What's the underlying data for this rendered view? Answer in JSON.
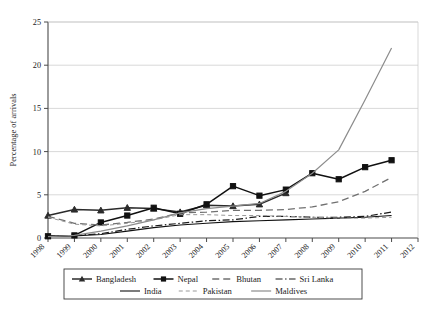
{
  "chart_data": {
    "type": "line",
    "title": "",
    "xlabel": "",
    "ylabel": "Percentage of arrivals",
    "xlim": [
      1998,
      2012
    ],
    "ylim": [
      0,
      25
    ],
    "grid": true,
    "legend_position": "bottom",
    "x": [
      1998,
      1999,
      2000,
      2001,
      2002,
      2003,
      2004,
      2005,
      2006,
      2007,
      2008,
      2009,
      2010,
      2011
    ],
    "xticks": [
      "1998",
      "1999",
      "2000",
      "2001",
      "2002",
      "2003",
      "2004",
      "2005",
      "2006",
      "2007",
      "2008",
      "2009",
      "2010",
      "2011",
      "2012"
    ],
    "yticks": [
      "0",
      "5",
      "10",
      "15",
      "20",
      "25"
    ],
    "series": [
      {
        "name": "Bangladesh",
        "marker": "triangle",
        "style": "solid",
        "color": "#2b2b2b",
        "values": [
          2.6,
          3.3,
          3.2,
          3.5,
          3.4,
          3.0,
          3.8,
          3.7,
          3.9,
          5.2,
          null,
          null,
          null,
          null
        ]
      },
      {
        "name": "Nepal",
        "marker": "square",
        "style": "solid",
        "color": "#111111",
        "values": [
          0.2,
          0.3,
          1.8,
          2.6,
          3.5,
          2.8,
          3.9,
          6.0,
          4.9,
          5.6,
          7.5,
          6.8,
          8.2,
          9.0
        ]
      },
      {
        "name": "Bhutan",
        "marker": "none",
        "style": "dashed",
        "color": "#707070",
        "values": [
          2.5,
          1.7,
          1.5,
          1.8,
          2.2,
          2.9,
          3.0,
          3.2,
          3.2,
          3.3,
          3.6,
          4.2,
          5.4,
          7.0
        ]
      },
      {
        "name": "Sri Lanka",
        "marker": "none",
        "style": "dashdot",
        "color": "#1a1a1a",
        "values": [
          0.25,
          0.3,
          0.5,
          1.0,
          1.4,
          1.7,
          2.0,
          2.1,
          2.5,
          2.5,
          2.4,
          2.4,
          2.5,
          3.0
        ]
      },
      {
        "name": "India",
        "marker": "none",
        "style": "solid-thin",
        "color": "#111111",
        "values": [
          0.2,
          0.25,
          0.4,
          0.8,
          1.2,
          1.5,
          1.7,
          1.9,
          2.0,
          2.1,
          2.2,
          2.3,
          2.4,
          2.6
        ]
      },
      {
        "name": "Pakistan",
        "marker": "none",
        "style": "finedash",
        "color": "#999999",
        "values": [
          2.4,
          1.6,
          1.4,
          1.7,
          2.1,
          2.7,
          2.7,
          2.6,
          2.6,
          2.5,
          2.4,
          2.3,
          2.3,
          2.4
        ]
      },
      {
        "name": "Maldives",
        "marker": "none",
        "style": "solid-gray",
        "color": "#8c8c8c",
        "values": [
          0.15,
          0.3,
          0.8,
          1.4,
          2.1,
          2.9,
          3.4,
          3.7,
          4.0,
          5.4,
          7.5,
          10.2,
          16.0,
          22.0
        ]
      }
    ]
  },
  "legend": {
    "row1": [
      "Bangladesh",
      "Nepal",
      "Bhutan",
      "Sri Lanka"
    ],
    "row2": [
      "India",
      "Pakistan",
      "Maldives"
    ]
  }
}
